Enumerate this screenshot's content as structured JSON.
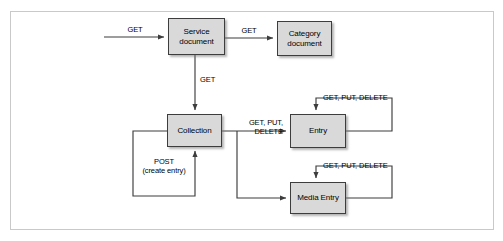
{
  "figure": {
    "type": "flow-diagram",
    "title": "",
    "background_color": "#ffffff",
    "frame_border_color": "#c9c9c9",
    "node_fill_color": "#d9d9d9",
    "node_border_color": "#3d3d3d",
    "line_color": "#3d3d3d"
  },
  "nodes": [
    {
      "id": "service-document",
      "label": "Service\ndocument",
      "x": 168,
      "y": 18,
      "w": 57,
      "h": 37
    },
    {
      "id": "category-document",
      "label": "Category\ndocument",
      "x": 277,
      "y": 21,
      "w": 55,
      "h": 35
    },
    {
      "id": "collection",
      "label": "Collection",
      "x": 167,
      "y": 114,
      "w": 55,
      "h": 33
    },
    {
      "id": "entry",
      "label": "Entry",
      "x": 290,
      "y": 114,
      "w": 56,
      "h": 34
    },
    {
      "id": "media-entry",
      "label": "Media Entry",
      "x": 290,
      "y": 182,
      "w": 56,
      "h": 32
    }
  ],
  "edges": [
    {
      "id": "external-to-service",
      "label": "GET",
      "from": "external",
      "to": "service-document"
    },
    {
      "id": "service-to-category",
      "label": "GET",
      "from": "service-document",
      "to": "category-document"
    },
    {
      "id": "service-to-collection",
      "label": "GET",
      "from": "service-document",
      "to": "collection"
    },
    {
      "id": "collection-to-entry",
      "label": "GET, PUT,\nDELETE",
      "from": "collection",
      "to": "entry"
    },
    {
      "id": "collection-to-media-entry",
      "label": "",
      "from": "collection",
      "to": "media-entry"
    },
    {
      "id": "collection-self-post",
      "label": "POST\n(create entry)",
      "from": "collection",
      "to": "collection"
    },
    {
      "id": "entry-self-loop",
      "label": "GET, PUT, DELETE",
      "from": "entry",
      "to": "entry"
    },
    {
      "id": "media-entry-self-loop",
      "label": "GET, PUT, DELETE",
      "from": "media-entry",
      "to": "media-entry"
    }
  ],
  "labels": {
    "get_external": "GET",
    "get_service_category": "GET",
    "get_service_collection": "GET",
    "get_put_delete_collection_entry": "GET, PUT,\nDELETE",
    "post_create_entry": "POST\n(create entry)",
    "get_put_delete_entry": "GET, PUT, DELETE",
    "get_put_delete_media_entry": "GET, PUT, DELETE"
  },
  "node_labels": {
    "service_document": "Service\ndocument",
    "category_document": "Category\ndocument",
    "collection": "Collection",
    "entry": "Entry",
    "media_entry": "Media Entry"
  }
}
